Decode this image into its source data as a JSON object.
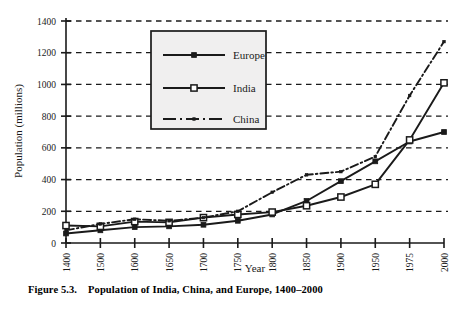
{
  "figure": {
    "caption_number": "Figure 5.3.",
    "caption_text": "Population of India, China, and Europe, 1400–2000"
  },
  "axes": {
    "y_title": "Population (millions)",
    "x_title": "Year",
    "y_ticks": [
      "0",
      "200",
      "400",
      "600",
      "800",
      "1000",
      "1200",
      "1400"
    ],
    "x_ticks": [
      "1400",
      "1500",
      "1600",
      "1650",
      "1700",
      "1750",
      "1800",
      "1850",
      "1900",
      "1950",
      "1975",
      "2000"
    ]
  },
  "legend": {
    "items": [
      {
        "label": "Europe",
        "marker": "filled-square",
        "line": "solid",
        "color": "#1a1a1a"
      },
      {
        "label": "India",
        "marker": "open-square",
        "line": "solid",
        "color": "#1a1a1a"
      },
      {
        "label": "China",
        "marker": "small-dot",
        "line": "dash-dot",
        "color": "#1a1a1a"
      }
    ]
  },
  "chart_data": {
    "type": "line",
    "title": "Population of India, China, and Europe, 1400–2000",
    "xlabel": "Year",
    "ylabel": "Population (millions)",
    "categories": [
      "1400",
      "1500",
      "1600",
      "1650",
      "1700",
      "1750",
      "1800",
      "1850",
      "1900",
      "1950",
      "1975",
      "2000"
    ],
    "ylim": [
      0,
      1400
    ],
    "ytick_step": 200,
    "grid": "horizontal-dashed",
    "legend_position": "upper-center-left",
    "series": [
      {
        "name": "Europe",
        "marker": "filled-square",
        "line": "solid",
        "color": "#1a1a1a",
        "values": [
          60,
          80,
          100,
          105,
          115,
          140,
          180,
          265,
          390,
          515,
          640,
          700
        ]
      },
      {
        "name": "India",
        "marker": "open-square",
        "line": "solid",
        "color": "#1a1a1a",
        "values": [
          110,
          105,
          135,
          130,
          160,
          180,
          195,
          235,
          290,
          370,
          650,
          1010
        ]
      },
      {
        "name": "China",
        "marker": "small-dot",
        "line": "dash-dot",
        "color": "#1a1a1a",
        "values": [
          80,
          120,
          150,
          140,
          160,
          200,
          320,
          430,
          450,
          545,
          930,
          1270
        ]
      }
    ]
  }
}
